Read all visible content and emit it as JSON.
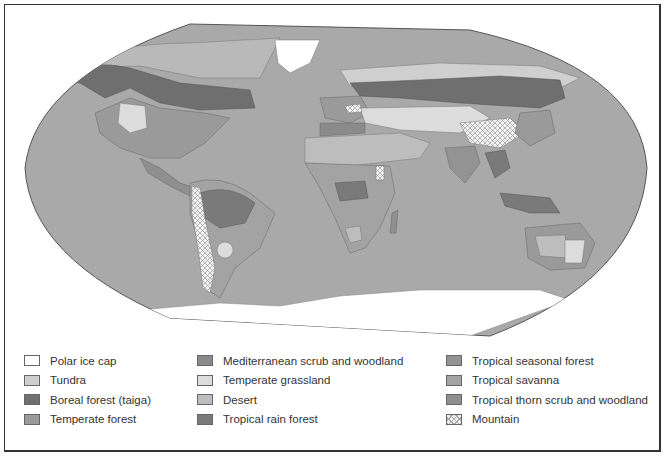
{
  "map": {
    "title": "World biomes map",
    "ocean_color": "#a9a9a9",
    "border_color": "#555555"
  },
  "legend": {
    "columns": [
      {
        "items": [
          {
            "label": "Polar ice cap",
            "color": "#ffffff",
            "pattern": "none"
          },
          {
            "label": "Tundra",
            "color": "#cfcfcf",
            "pattern": "none"
          },
          {
            "label": "Boreal forest (taiga)",
            "color": "#6f6f6f",
            "pattern": "none"
          },
          {
            "label": "Temperate forest",
            "color": "#9a9a9a",
            "pattern": "none"
          }
        ]
      },
      {
        "items": [
          {
            "label": "Mediterranean scrub and woodland",
            "color": "#8a8a8a",
            "pattern": "none"
          },
          {
            "label": "Temperate grassland",
            "color": "#dcdcdc",
            "pattern": "none"
          },
          {
            "label": "Desert",
            "color": "#bdbdbd",
            "pattern": "none"
          },
          {
            "label": "Tropical rain forest",
            "color": "#7a7a7a",
            "pattern": "none"
          }
        ]
      },
      {
        "items": [
          {
            "label": "Tropical seasonal forest",
            "color": "#939393",
            "pattern": "none"
          },
          {
            "label": "Tropical savanna",
            "color": "#a3a3a3",
            "pattern": "none"
          },
          {
            "label": "Tropical thorn scrub and woodland",
            "color": "#8f8f8f",
            "pattern": "none"
          },
          {
            "label": "Mountain",
            "color": "#f2f2f2",
            "pattern": "crosshatch"
          }
        ]
      }
    ]
  }
}
